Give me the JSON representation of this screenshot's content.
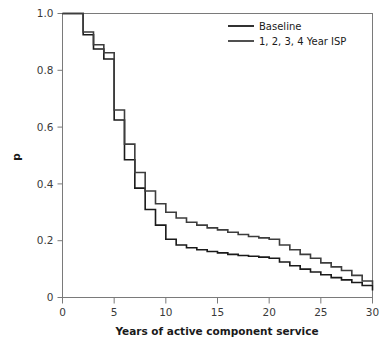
{
  "chart_data": {
    "type": "line",
    "title": "",
    "subtitle": "",
    "xlabel": "Years of active component service",
    "ylabel": "p",
    "xlim": [
      0,
      30
    ],
    "ylim": [
      0,
      1.0
    ],
    "grid": false,
    "legend_position": "top-right",
    "step_style": "post",
    "xticks": [
      0,
      5,
      10,
      15,
      20,
      25,
      30
    ],
    "xticklabels": [
      "0",
      "5",
      "10",
      "15",
      "20",
      "25",
      "30"
    ],
    "yticks": [
      0,
      0.2,
      0.4,
      0.6,
      0.8,
      1.0
    ],
    "yticklabels": [
      "0",
      "0.2",
      "0.4",
      "0.6",
      "0.8",
      "1.0"
    ],
    "series": [
      {
        "name": "Baseline",
        "color": "#1a1a1a",
        "linewidth": 1.6,
        "x": [
          0,
          1,
          2,
          3,
          4,
          5,
          6,
          7,
          8,
          9,
          10,
          11,
          12,
          13,
          14,
          15,
          16,
          17,
          18,
          19,
          20,
          21,
          22,
          23,
          24,
          25,
          26,
          27,
          28,
          29,
          30
        ],
        "values": [
          1.0,
          1.0,
          0.925,
          0.875,
          0.84,
          0.625,
          0.485,
          0.385,
          0.31,
          0.255,
          0.205,
          0.185,
          0.175,
          0.168,
          0.162,
          0.157,
          0.152,
          0.148,
          0.145,
          0.142,
          0.138,
          0.125,
          0.112,
          0.1,
          0.09,
          0.08,
          0.07,
          0.062,
          0.053,
          0.042,
          0.025
        ]
      },
      {
        "name": "1, 2, 3, 4 Year ISP",
        "color": "#3d3d3d",
        "linewidth": 1.6,
        "x": [
          0,
          1,
          2,
          3,
          4,
          5,
          6,
          7,
          8,
          9,
          10,
          11,
          12,
          13,
          14,
          15,
          16,
          17,
          18,
          19,
          20,
          21,
          22,
          23,
          24,
          25,
          26,
          27,
          28,
          29,
          30
        ],
        "values": [
          1.0,
          1.0,
          0.935,
          0.89,
          0.862,
          0.66,
          0.54,
          0.44,
          0.375,
          0.33,
          0.3,
          0.28,
          0.265,
          0.255,
          0.245,
          0.238,
          0.23,
          0.222,
          0.215,
          0.21,
          0.205,
          0.185,
          0.168,
          0.152,
          0.138,
          0.122,
          0.108,
          0.095,
          0.078,
          0.058,
          0.045
        ]
      }
    ],
    "legend": [
      {
        "label": "Baseline",
        "color": "#1a1a1a"
      },
      {
        "label": "1, 2, 3, 4 Year ISP",
        "color": "#3d3d3d"
      }
    ],
    "colors": {
      "background": "#ffffff",
      "frame": "#7a7a7a",
      "text": "#1a1a1a",
      "tick_text": "#3a3a3a"
    }
  }
}
